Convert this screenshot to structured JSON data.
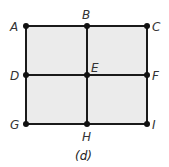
{
  "diagram": {
    "caption": "(d)",
    "fill_color": "#ebebeb",
    "line_color": "#1a1a1a",
    "points": [
      {
        "id": "A",
        "label": "A",
        "x": 26,
        "y": 26
      },
      {
        "id": "B",
        "label": "B",
        "x": 87,
        "y": 26
      },
      {
        "id": "C",
        "label": "C",
        "x": 147,
        "y": 26
      },
      {
        "id": "D",
        "label": "D",
        "x": 26,
        "y": 75
      },
      {
        "id": "E",
        "label": "E",
        "x": 87,
        "y": 75
      },
      {
        "id": "F",
        "label": "F",
        "x": 147,
        "y": 75
      },
      {
        "id": "G",
        "label": "G",
        "x": 26,
        "y": 124
      },
      {
        "id": "H",
        "label": "H",
        "x": 87,
        "y": 124
      },
      {
        "id": "I",
        "label": "I",
        "x": 147,
        "y": 124
      }
    ],
    "edges": [
      [
        "A",
        "B"
      ],
      [
        "B",
        "C"
      ],
      [
        "D",
        "E"
      ],
      [
        "E",
        "F"
      ],
      [
        "G",
        "H"
      ],
      [
        "H",
        "I"
      ],
      [
        "A",
        "D"
      ],
      [
        "D",
        "G"
      ],
      [
        "B",
        "E"
      ],
      [
        "E",
        "H"
      ],
      [
        "C",
        "F"
      ],
      [
        "F",
        "I"
      ]
    ]
  }
}
